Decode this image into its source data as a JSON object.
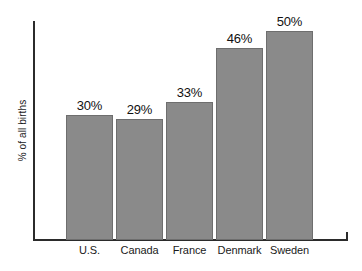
{
  "chart_data": {
    "type": "bar",
    "title": "",
    "subtitle": "",
    "xlabel": "",
    "ylabel": "% of all births",
    "categories": [
      "U.S.",
      "Canada",
      "France",
      "Denmark",
      "Sweden"
    ],
    "values": [
      30,
      29,
      33,
      46,
      50
    ],
    "value_labels": [
      "30%",
      "29%",
      "33%",
      "46%",
      "50%"
    ],
    "ylim": [
      0,
      52
    ],
    "grid": false,
    "legend": false,
    "legend_position": "none",
    "annotations": []
  },
  "style": {
    "bar_fill": "#8a8a8a",
    "bar_border": "#6e6e6e",
    "axis_color": "#2b2b2b",
    "text_color": "#111111",
    "background": "#ffffff"
  },
  "geometry": {
    "baseline_y": 240,
    "axis_left_x": 34,
    "axis_right_x": 348,
    "axis_top_y": 21,
    "bar_width": 47,
    "bar_gap": 3,
    "first_bar_left": 66,
    "px_per_percent": 4.18,
    "label_offset": 4
  }
}
